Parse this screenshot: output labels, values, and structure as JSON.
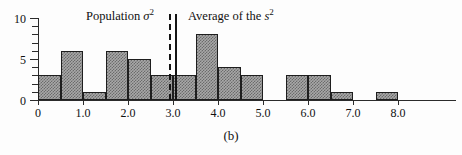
{
  "caption": "(b)",
  "annotations": {
    "population": {
      "text_prefix": "Population ",
      "symbol": "σ",
      "exponent": "2",
      "value": 2.9
    },
    "average": {
      "text_prefix": "Average of the ",
      "symbol": "s",
      "exponent": "2",
      "value": 3.05
    }
  },
  "axes": {
    "y_labels": [
      "0",
      "5",
      "10"
    ],
    "x_labels": [
      "0",
      "1.0",
      "2.0",
      "3.0",
      "4.0",
      "5.0",
      "6.0",
      "7.0",
      "8.0"
    ]
  },
  "chart_data": {
    "type": "bar",
    "title": "",
    "xlabel": "",
    "ylabel": "",
    "xlim": [
      0,
      8.4
    ],
    "ylim": [
      0,
      10
    ],
    "grid": false,
    "legend": "none",
    "bin_width": 0.5,
    "categories": [
      "0.0-0.5",
      "0.5-1.0",
      "1.0-1.5",
      "1.5-2.0",
      "2.0-2.5",
      "2.5-3.0",
      "3.0-3.5",
      "3.5-4.0",
      "4.0-4.5",
      "4.5-5.0",
      "5.0-5.5",
      "5.5-6.0",
      "6.0-6.5",
      "6.5-7.0",
      "7.0-7.5",
      "7.5-8.0"
    ],
    "bin_starts": [
      0.0,
      0.5,
      1.0,
      1.5,
      2.0,
      2.5,
      3.0,
      3.5,
      4.0,
      4.5,
      5.0,
      5.5,
      6.0,
      6.5,
      7.0,
      7.5
    ],
    "values": [
      3,
      6,
      1,
      6,
      5,
      3,
      3,
      8,
      4,
      3,
      0,
      3,
      3,
      1,
      0,
      1
    ],
    "y_ticks_major": [
      0,
      5,
      10
    ],
    "y_ticks_minor": [
      1,
      2,
      3,
      4,
      6,
      7,
      8,
      9
    ],
    "x_ticks": [
      0,
      1.0,
      2.0,
      3.0,
      4.0,
      5.0,
      6.0,
      7.0,
      8.0
    ],
    "reference_lines": [
      {
        "name": "population-variance",
        "value": 2.9,
        "style": "dashed",
        "label": "Population σ²"
      },
      {
        "name": "average-of-sample-variances",
        "value": 3.05,
        "style": "solid",
        "label": "Average of the s²"
      }
    ],
    "bar_color": "#a8a8a8",
    "bar_edge_color": "#1e1e1e"
  }
}
